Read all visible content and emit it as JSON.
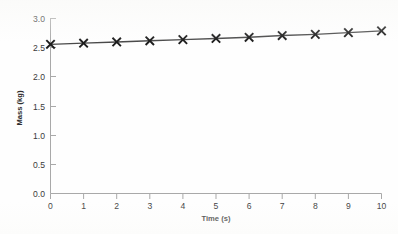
{
  "chart_data": {
    "type": "line",
    "title": "",
    "xlabel": "Time (s)",
    "ylabel": "Mass (kg)",
    "xlim": [
      0,
      10
    ],
    "ylim": [
      0,
      3.0
    ],
    "x_ticks": [
      "0",
      "1",
      "2",
      "3",
      "4",
      "5",
      "6",
      "7",
      "8",
      "9",
      "10"
    ],
    "y_ticks": [
      "0.0",
      "0.5",
      "1.0",
      "1.5",
      "2.0",
      "2.5",
      "3.0"
    ],
    "grid": false,
    "legend": "none",
    "marker": "x-cross",
    "line_color": "#4a4a4a",
    "marker_color": "#1c1c1c",
    "axis_color": "#a9a9a9",
    "x": [
      0,
      1,
      2,
      3,
      4,
      5,
      6,
      7,
      8,
      9,
      10
    ],
    "values": [
      2.55,
      2.57,
      2.59,
      2.61,
      2.63,
      2.65,
      2.67,
      2.7,
      2.72,
      2.75,
      2.78
    ],
    "series": [
      {
        "name": "Mass",
        "values": [
          2.55,
          2.57,
          2.59,
          2.61,
          2.63,
          2.65,
          2.67,
          2.7,
          2.72,
          2.75,
          2.78
        ]
      }
    ]
  }
}
